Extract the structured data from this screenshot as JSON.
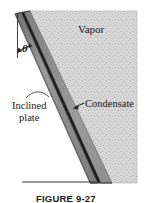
{
  "figure": {
    "caption": "FIGURE 9-27",
    "labels": {
      "vapor": "Vapor",
      "condensate": "Condensate",
      "inclined_plate_line1": "Inclined",
      "inclined_plate_line2": "plate",
      "angle_symbol": "θ"
    },
    "colors": {
      "vapor_fill": "#d6d6d6",
      "vapor_speckle": "#a8a8a8",
      "condensate_fill": "#8f8f8f",
      "plate_fill": "#8a8a8a",
      "plate_edge": "#4a4a4a",
      "interface_line": "#1c1c1c",
      "outline": "#4f4f4f",
      "ground_line": "#3a3a3a",
      "text": "#1a1a1a",
      "background": "#ffffff"
    },
    "geometry": {
      "plate_top_x": 17,
      "plate_top_y": 13,
      "plate_bottom_x": 103,
      "plate_bottom_y": 183,
      "vapor_right_x": 137,
      "vapor_top_y": 11,
      "ground_line_left_x": 22,
      "ground_line_y": 181,
      "incline_angle_label": "θ",
      "vertical_reference_x": 18
    }
  }
}
